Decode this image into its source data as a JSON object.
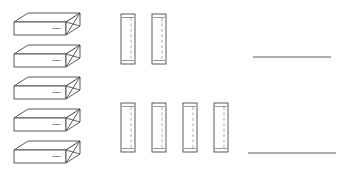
{
  "drawing": {
    "title": "Structural Member Layout",
    "background_color": "#ffffff",
    "line_color": "#3c3c3c",
    "hidden_line_color": "#8a8a8a",
    "rule_color": "#5a5a5a",
    "canvas": {
      "width": 338,
      "height": 177
    }
  },
  "beam_group": {
    "label": "Isometric Beams",
    "count": 5,
    "geometry": {
      "body_width": 52,
      "body_height": 13,
      "depth_x": 14,
      "depth_y": 9,
      "end_detail": "chamfered-notch"
    },
    "items": [
      {
        "id": "beam-1",
        "x": 14,
        "y": 22
      },
      {
        "id": "beam-2",
        "x": 14,
        "y": 54
      },
      {
        "id": "beam-3",
        "x": 14,
        "y": 86
      },
      {
        "id": "beam-4",
        "x": 14,
        "y": 118
      },
      {
        "id": "beam-5",
        "x": 14,
        "y": 150
      }
    ]
  },
  "post_group_upper": {
    "label": "Upper Posts",
    "count": 2,
    "geometry": {
      "width": 14,
      "height": 50,
      "cap_offset": 4
    },
    "items": [
      {
        "id": "post-u1",
        "x": 121,
        "y": 14
      },
      {
        "id": "post-u2",
        "x": 152,
        "y": 14
      }
    ]
  },
  "post_group_lower": {
    "label": "Lower Posts",
    "count": 4,
    "geometry": {
      "width": 14,
      "height": 49,
      "cap_offset": 4
    },
    "items": [
      {
        "id": "post-l1",
        "x": 121,
        "y": 103
      },
      {
        "id": "post-l2",
        "x": 152,
        "y": 103
      },
      {
        "id": "post-l3",
        "x": 183,
        "y": 103
      },
      {
        "id": "post-l4",
        "x": 214,
        "y": 103
      }
    ]
  },
  "rules": {
    "label": "Reference Lines",
    "count": 2,
    "items": [
      {
        "id": "rule-upper",
        "x1": 253,
        "y1": 57,
        "x2": 331,
        "y2": 57
      },
      {
        "id": "rule-lower",
        "x1": 248,
        "y1": 153,
        "x2": 336,
        "y2": 153
      }
    ]
  }
}
